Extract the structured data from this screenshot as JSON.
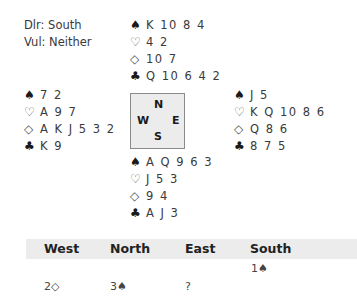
{
  "deal_info": {
    "dealer": "Dlr: South",
    "vulnerability": "Vul: Neither"
  },
  "suits": {
    "spade": "♠",
    "heart": "♡",
    "diamond": "◇",
    "club": "♣"
  },
  "hands": {
    "north": {
      "spades": "K 10 8 4",
      "hearts": "4 2",
      "diamonds": "10 7",
      "clubs": "Q 10 6 4 2"
    },
    "west": {
      "spades": "7 2",
      "hearts": "A 9 7",
      "diamonds": "A K J 5 3 2",
      "clubs": "K 9"
    },
    "east": {
      "spades": "J 5",
      "hearts": "K Q 10 8 6",
      "diamonds": "Q 8 6",
      "clubs": "8 7 5"
    },
    "south": {
      "spades": "A Q 9 6 3",
      "hearts": "J 5 3",
      "diamonds": "9 4",
      "clubs": "A J 3"
    }
  },
  "compass": {
    "n": "N",
    "w": "W",
    "e": "E",
    "s": "S"
  },
  "bidding": {
    "headers": [
      "West",
      "North",
      "East",
      "South"
    ],
    "rows": [
      [
        "",
        "",
        "",
        "1♠"
      ],
      [
        "2◇",
        "3♠",
        "?",
        ""
      ]
    ]
  }
}
